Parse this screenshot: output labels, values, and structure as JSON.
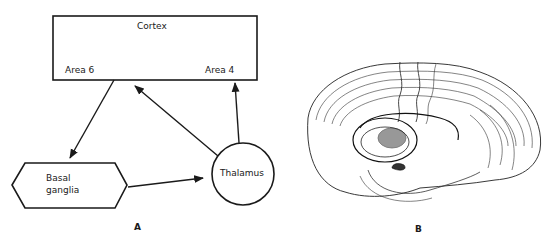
{
  "panel_a": {
    "label": "A",
    "nodes": {
      "cortex": {
        "title": "Cortex",
        "area_left": "Area 6",
        "area_right": "Area 4"
      },
      "basal_ganglia": {
        "line1": "Basal",
        "line2": "ganglia"
      },
      "thalamus": {
        "label": "Thalamus"
      }
    },
    "edges": [
      {
        "from": "Area 6",
        "to": "Basal ganglia"
      },
      {
        "from": "Basal ganglia",
        "to": "Thalamus"
      },
      {
        "from": "Thalamus",
        "to": "Area 6"
      },
      {
        "from": "Thalamus",
        "to": "Area 4"
      }
    ]
  },
  "panel_b": {
    "label": "B",
    "illustration": "brain-lateral-view-with-basal-ganglia"
  },
  "colors": {
    "ink": "#1a1a1a",
    "background": "#ffffff"
  }
}
